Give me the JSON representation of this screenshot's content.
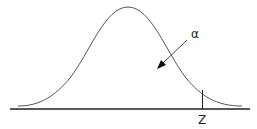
{
  "diagram": {
    "type": "normal-distribution-upper-tail",
    "labels": {
      "alpha": "α",
      "z": "Z"
    },
    "colors": {
      "curve": "#555555",
      "axis": "#222222",
      "background": "#ffffff"
    }
  }
}
